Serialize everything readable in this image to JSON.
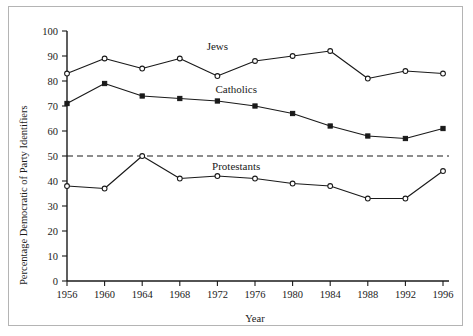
{
  "chart_data": {
    "type": "line",
    "title": "",
    "xlabel": "Year",
    "ylabel": "Percentage Democratic of Party Identifiers",
    "x": [
      1956,
      1960,
      1964,
      1968,
      1972,
      1976,
      1980,
      1984,
      1988,
      1992,
      1996
    ],
    "categories": [
      "1956",
      "1960",
      "1964",
      "1968",
      "1972",
      "1976",
      "1980",
      "1984",
      "1988",
      "1992",
      "1996"
    ],
    "xlim": [
      1956,
      1996
    ],
    "ylim": [
      0,
      100
    ],
    "yticks": [
      0,
      10,
      20,
      30,
      40,
      50,
      60,
      70,
      80,
      90,
      100
    ],
    "ytick_labels": [
      "0",
      "10",
      "20",
      "30",
      "40",
      "50",
      "60",
      "70",
      "80",
      "90",
      "100"
    ],
    "grid": false,
    "legend": "inline-series-labels",
    "reference_line": {
      "value": 50,
      "style": "dashed",
      "label": ""
    },
    "series": [
      {
        "name": "Jews",
        "marker": "open-circle",
        "label_x": 1972,
        "label_y": 94,
        "values": [
          83,
          89,
          85,
          89,
          82,
          88,
          90,
          92,
          81,
          84,
          83
        ]
      },
      {
        "name": "Catholics",
        "marker": "filled-square",
        "label_x": 1974,
        "label_y": 77,
        "values": [
          71,
          79,
          74,
          73,
          72,
          70,
          67,
          62,
          58,
          57,
          61
        ]
      },
      {
        "name": "Protestants",
        "marker": "open-circle",
        "label_x": 1974,
        "label_y": 46,
        "values": [
          38,
          37,
          50,
          41,
          42,
          41,
          39,
          38,
          33,
          33,
          44
        ]
      }
    ]
  },
  "axes": {
    "x_title": "Year",
    "y_title": "Percentage Democratic of Party Identifiers"
  }
}
